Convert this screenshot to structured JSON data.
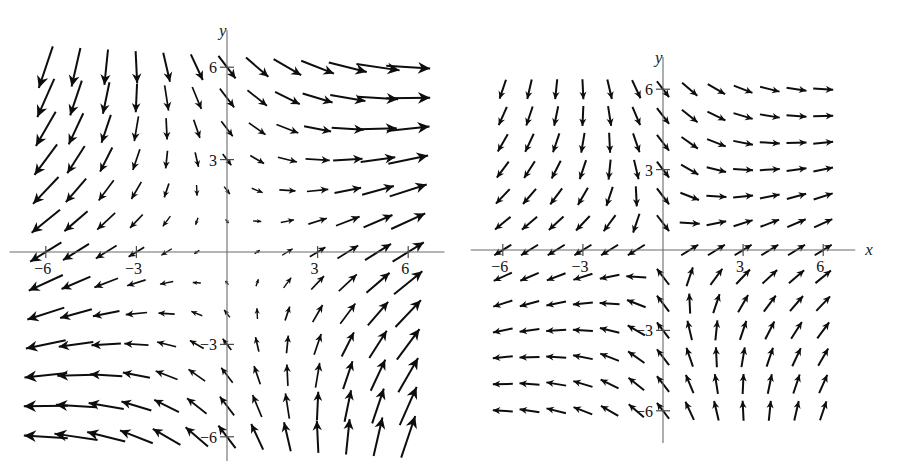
{
  "figure": {
    "title": "",
    "background_color": "#ffffff",
    "ink_color": "#0d0d0d",
    "axis_color": "#6b6b6b",
    "width": 906,
    "height": 463
  },
  "panels": [
    {
      "id": "left-panel",
      "name": "direction-field-left",
      "x_axis_label": "x",
      "y_axis_label": "y",
      "x_tick_labels": [
        "-6",
        "-3",
        "3",
        "6"
      ],
      "y_tick_labels": [
        "6",
        "3",
        "-3",
        "-6"
      ],
      "x_ticks": [
        -6,
        -3,
        3,
        6
      ],
      "y_ticks": [
        6,
        3,
        -3,
        -6
      ],
      "xlim": [
        -7.2,
        7.2
      ],
      "ylim": [
        -7.2,
        7.2
      ],
      "arrows_normalized": false,
      "grid_step": 1,
      "note": "arrow length proportional to vector magnitude"
    },
    {
      "id": "right-panel",
      "name": "direction-field-right",
      "x_axis_label": "x",
      "y_axis_label": "y",
      "x_tick_labels": [
        "-6",
        "-3",
        "3",
        "6"
      ],
      "y_tick_labels": [
        "6",
        "3",
        "-3",
        "-6"
      ],
      "x_ticks": [
        -6,
        -3,
        3,
        6
      ],
      "y_ticks": [
        6,
        3,
        -3,
        -6
      ],
      "xlim": [
        -7.2,
        7.2
      ],
      "ylim": [
        -7.2,
        7.2
      ],
      "arrows_normalized": true,
      "grid_step": 1,
      "note": "all arrows drawn with equal length"
    }
  ],
  "chart_data": [
    {
      "type": "quiver",
      "title": "",
      "xlabel": "x",
      "ylabel": "y",
      "xlim": [
        -7.2,
        7.2
      ],
      "ylim": [
        -7.2,
        7.2
      ],
      "xticks": [
        -6,
        -3,
        3,
        6
      ],
      "yticks": [
        6,
        3,
        -3,
        -6
      ],
      "grid": false,
      "legend": "none",
      "normalized": false,
      "sample_step": 1,
      "sample_range": [
        -6.5,
        6.5
      ],
      "u_formula": "x + 0.55*y",
      "v_formula": "0.62*x - 0.72*y",
      "scale_px_per_unit_magnitude": 5.2,
      "max_arrow_px": 44,
      "description": "Saddle-type direction field; arrows in upper-left point down-left, upper-right point right, lower-left point left, lower-right point up-right. Arrow lengths grow with distance from the origin."
    },
    {
      "type": "quiver",
      "title": "",
      "xlabel": "x",
      "ylabel": "y",
      "xlim": [
        -7.2,
        7.2
      ],
      "ylim": [
        -7.2,
        7.2
      ],
      "xticks": [
        -6,
        -3,
        3,
        6
      ],
      "yticks": [
        6,
        3,
        -3,
        -6
      ],
      "grid": false,
      "legend": "none",
      "normalized": true,
      "sample_step": 1,
      "sample_range": [
        -6.5,
        6.5
      ],
      "u_formula": "x + 0.55*y",
      "v_formula": "0.62*x - 0.72*y",
      "uniform_arrow_px": 20,
      "description": "Same saddle-type direction field rendered with unit-length (normalized) arrows on a regular lattice."
    }
  ]
}
